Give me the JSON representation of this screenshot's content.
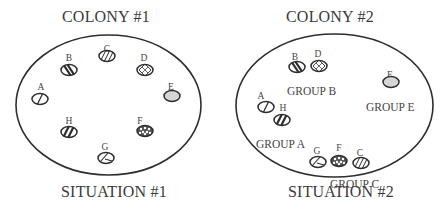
{
  "panels": [
    {
      "id": "situation-1",
      "title": "COLONY #1",
      "caption": "SITUATION #1",
      "title_pos": [
        62,
        10
      ],
      "caption_pos": [
        61,
        185
      ],
      "dish": {
        "cx": 108.5,
        "cy": 105,
        "rx": 92.5,
        "ry": 70
      },
      "colonies": [
        {
          "label": "A",
          "pattern": "single-hatch",
          "x": 40,
          "y": 99,
          "lx": 41,
          "ly": 82
        },
        {
          "label": "B",
          "pattern": "bold-hatch",
          "x": 69,
          "y": 70,
          "lx": 69,
          "ly": 53
        },
        {
          "label": "C",
          "pattern": "fine-hatch",
          "x": 107,
          "y": 56,
          "lx": 107,
          "ly": 44
        },
        {
          "label": "D",
          "pattern": "crosshatch",
          "x": 145,
          "y": 70,
          "lx": 144,
          "ly": 53
        },
        {
          "label": "E",
          "pattern": "gray-fill",
          "x": 172,
          "y": 96,
          "lx": 171,
          "ly": 82
        },
        {
          "label": "F",
          "pattern": "dotted",
          "x": 145,
          "y": 131,
          "lx": 140,
          "ly": 116
        },
        {
          "label": "G",
          "pattern": "split",
          "x": 106,
          "y": 158,
          "lx": 105,
          "ly": 142
        },
        {
          "label": "H",
          "pattern": "bold-hatch-alt",
          "x": 69,
          "y": 132,
          "lx": 69,
          "ly": 116
        }
      ],
      "groups": []
    },
    {
      "id": "situation-2",
      "title": "COLONY #2",
      "caption": "SITUATION #2",
      "title_pos": [
        286,
        10
      ],
      "caption_pos": [
        288,
        185
      ],
      "dish": {
        "cx": 334.5,
        "cy": 105.5,
        "rx": 98.5,
        "ry": 71.5
      },
      "colonies": [
        {
          "label": "B",
          "pattern": "bold-hatch",
          "x": 297,
          "y": 67,
          "lx": 295,
          "ly": 52
        },
        {
          "label": "D",
          "pattern": "crosshatch",
          "x": 319,
          "y": 66,
          "lx": 318,
          "ly": 49
        },
        {
          "label": "E",
          "pattern": "gray-fill",
          "x": 391,
          "y": 82,
          "lx": 390,
          "ly": 70
        },
        {
          "label": "A",
          "pattern": "single-hatch",
          "x": 266,
          "y": 107,
          "lx": 261,
          "ly": 91
        },
        {
          "label": "H",
          "pattern": "bold-hatch-alt",
          "x": 282,
          "y": 120,
          "lx": 283,
          "ly": 103
        },
        {
          "label": "G",
          "pattern": "split",
          "x": 318,
          "y": 162,
          "lx": 317,
          "ly": 146
        },
        {
          "label": "F",
          "pattern": "dotted",
          "x": 339,
          "y": 161,
          "lx": 339,
          "ly": 143
        },
        {
          "label": "C",
          "pattern": "fine-hatch",
          "x": 361,
          "y": 163,
          "lx": 360,
          "ly": 148
        }
      ],
      "groups": [
        {
          "label": "GROUP B",
          "x": 287,
          "y": 85
        },
        {
          "label": "GROUP E",
          "x": 366,
          "y": 101
        },
        {
          "label": "GROUP A",
          "x": 256,
          "y": 138
        },
        {
          "label": "GROUP C",
          "x": 330,
          "y": 178
        }
      ]
    }
  ],
  "colors": {
    "outline": "#2e2e2e",
    "text": "#3a3a3a",
    "gray_fill": "#d6d6d6"
  }
}
